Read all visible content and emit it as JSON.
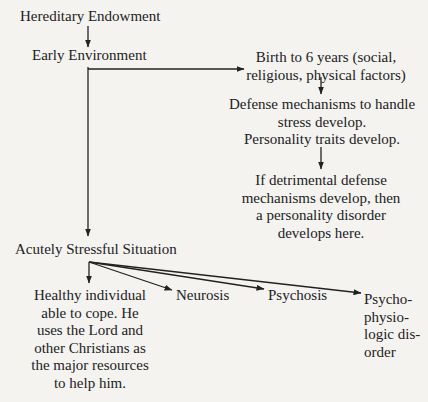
{
  "diagram": {
    "type": "flowchart",
    "nodes": {
      "hereditary": {
        "label": "Hereditary Endowment"
      },
      "early_env": {
        "label": "Early Environment"
      },
      "birth": {
        "lines": [
          "Birth to 6 years (social,",
          "religious, physical factors)"
        ]
      },
      "defense": {
        "lines": [
          "Defense mechanisms to handle",
          "stress develop.",
          "Personality traits develop."
        ]
      },
      "detrimental": {
        "lines": [
          "If detrimental defense",
          "mechanisms develop, then",
          "a personality disorder",
          "develops here."
        ]
      },
      "acute": {
        "label": "Acutely Stressful Situation"
      },
      "healthy": {
        "lines": [
          "Healthy individual",
          "able to cope. He",
          "uses the Lord and",
          "other Christians as",
          "the major resources",
          "to help him."
        ]
      },
      "neurosis": {
        "label": "Neurosis"
      },
      "psychosis": {
        "label": "Psychosis"
      },
      "psychophysiologic": {
        "lines": [
          "Psycho-",
          "physio-",
          "logic dis-",
          "order"
        ]
      }
    },
    "edges": [
      {
        "from": "hereditary",
        "to": "early_env"
      },
      {
        "from": "early_env",
        "to": "birth"
      },
      {
        "from": "early_env",
        "to": "acute"
      },
      {
        "from": "birth",
        "to": "defense"
      },
      {
        "from": "defense",
        "to": "detrimental"
      },
      {
        "from": "acute",
        "to": "healthy"
      },
      {
        "from": "acute",
        "to": "neurosis"
      },
      {
        "from": "acute",
        "to": "psychosis"
      },
      {
        "from": "acute",
        "to": "psychophysiologic"
      }
    ],
    "colors": {
      "background": "#f4f3f0",
      "ink": "#222222"
    }
  }
}
